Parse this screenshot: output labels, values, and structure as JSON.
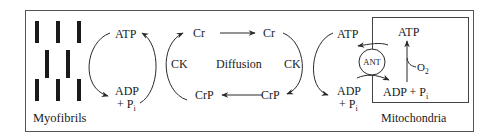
{
  "diagram": {
    "type": "creatine-phosphate-shuttle",
    "colors": {
      "line": "#2a2a2a",
      "background": "#ffffff",
      "fibril": "#1a1a1a"
    },
    "labels": {
      "myofibrils": "Myofibrils",
      "mitochondria": "Mitochondria",
      "atp_left": "ATP",
      "adp_left": "ADP",
      "pi_left_plus": "+ P",
      "pi_left_sub": "i",
      "ck_left": "CK",
      "cr_left": "Cr",
      "crp_left": "CrP",
      "diffusion": "Diffusion",
      "cr_right": "Cr",
      "crp_right": "CrP",
      "ck_right": "CK",
      "atp_right": "ATP",
      "adp_right": "ADP",
      "pi_right_plus": "+ P",
      "pi_right_sub": "i",
      "ant": "ANT",
      "atp_mito": "ATP",
      "o2": "O",
      "o2_sub": "2",
      "adp_mito": "ADP + P",
      "adp_mito_sub": "i"
    }
  }
}
